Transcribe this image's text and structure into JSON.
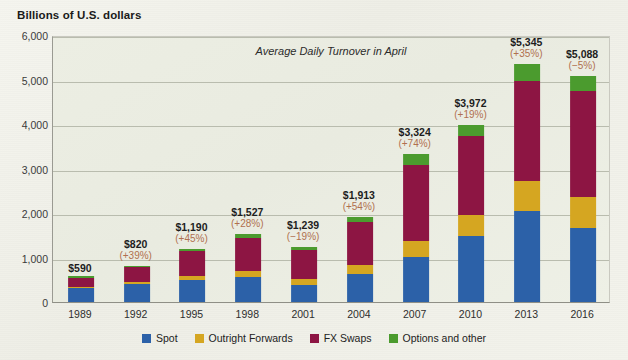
{
  "axis_title": "Billions of U.S. dollars",
  "chart_title": "Average Daily Turnover in April",
  "legend": {
    "items": [
      {
        "label": "Spot",
        "color": "#2c61a8",
        "key": "spot"
      },
      {
        "label": "Outright Forwards",
        "color": "#d5a621",
        "key": "forwards"
      },
      {
        "label": "FX Swaps",
        "color": "#8d1543",
        "key": "swaps"
      },
      {
        "label": "Options and other",
        "color": "#4b9b2e",
        "key": "options"
      }
    ]
  },
  "chart_data": {
    "type": "bar",
    "stacked": true,
    "title": "Average Daily Turnover in April",
    "xlabel": "",
    "ylabel": "Billions of U.S. dollars",
    "ylim": [
      0,
      6000
    ],
    "ytick_values": [
      0,
      1000,
      2000,
      3000,
      4000,
      5000,
      6000
    ],
    "ytick_labels": [
      "0",
      "1,000",
      "2,000",
      "3,000",
      "4,000",
      "5,000",
      "6,000"
    ],
    "grid": true,
    "legend_position": "bottom",
    "categories": [
      "1989",
      "1992",
      "1995",
      "1998",
      "2001",
      "2004",
      "2007",
      "2010",
      "2013",
      "2016"
    ],
    "series": [
      {
        "name": "Spot",
        "color": "#2c61a8",
        "values": [
          317,
          394,
          494,
          568,
          386,
          631,
          1005,
          1489,
          2046,
          1654
        ]
      },
      {
        "name": "Outright Forwards",
        "color": "#d5a621",
        "values": [
          27,
          58,
          97,
          128,
          130,
          209,
          362,
          475,
          680,
          700
        ]
      },
      {
        "name": "FX Swaps",
        "color": "#8d1543",
        "values": [
          190,
          324,
          546,
          734,
          656,
          954,
          1714,
          1759,
          2240,
          2378
        ]
      },
      {
        "name": "Options and other",
        "color": "#4b9b2e",
        "values": [
          56,
          44,
          53,
          97,
          67,
          119,
          243,
          249,
          379,
          356
        ]
      }
    ],
    "totals": [
      590,
      820,
      1190,
      1527,
      1239,
      1913,
      3324,
      3972,
      5345,
      5088
    ],
    "total_labels": [
      "$590",
      "$820",
      "$1,190",
      "$1,527",
      "$1,239",
      "$1,913",
      "$3,324",
      "$3,972",
      "$5,345",
      "$5,088"
    ],
    "change_labels": [
      "",
      "(+39%)",
      "(+45%)",
      "(+28%)",
      "(−19%)",
      "(+54%)",
      "(+74%)",
      "(+19%)",
      "(+35%)",
      "(−5%)"
    ]
  },
  "colors": {
    "background": "#f2f2ec",
    "plot_background": "#eceee3",
    "gridline": "#b9bcae",
    "value_label": "#1d1d1d",
    "change_label": "#b0704f"
  }
}
